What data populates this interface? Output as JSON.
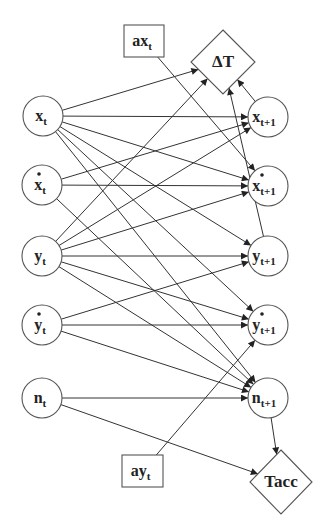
{
  "diagram": {
    "type": "dynamic bayesian network",
    "colors": {
      "stroke": "#333333",
      "background": "#ffffff",
      "text": "#222222"
    },
    "nodes": [
      {
        "id": "xt",
        "shape": "circle",
        "label": "x",
        "sub": "t",
        "dot": false,
        "cx": 43,
        "cy": 116,
        "r": 20
      },
      {
        "id": "dxt",
        "shape": "circle",
        "label": "x",
        "sub": "t",
        "dot": true,
        "cx": 42,
        "cy": 185,
        "r": 20
      },
      {
        "id": "yt",
        "shape": "circle",
        "label": "y",
        "sub": "t",
        "dot": false,
        "cx": 42,
        "cy": 256,
        "r": 20
      },
      {
        "id": "dyt",
        "shape": "circle",
        "label": "y",
        "sub": "t",
        "dot": true,
        "cx": 42,
        "cy": 325,
        "r": 20
      },
      {
        "id": "nt",
        "shape": "circle",
        "label": "n",
        "sub": "t",
        "dot": false,
        "cx": 42,
        "cy": 398,
        "r": 20
      },
      {
        "id": "xt1",
        "shape": "circle",
        "label": "x",
        "sub": "t+1",
        "dot": false,
        "cx": 268,
        "cy": 117,
        "r": 20
      },
      {
        "id": "dxt1",
        "shape": "circle",
        "label": "x",
        "sub": "t+1",
        "dot": true,
        "cx": 268,
        "cy": 186,
        "r": 20
      },
      {
        "id": "yt1",
        "shape": "circle",
        "label": "y",
        "sub": "t+1",
        "dot": false,
        "cx": 268,
        "cy": 256,
        "r": 20
      },
      {
        "id": "dyt1",
        "shape": "circle",
        "label": "y",
        "sub": "t+1",
        "dot": true,
        "cx": 268,
        "cy": 325,
        "r": 20
      },
      {
        "id": "nt1",
        "shape": "circle",
        "label": "n",
        "sub": "t+1",
        "dot": false,
        "cx": 268,
        "cy": 398,
        "r": 20
      },
      {
        "id": "axt",
        "shape": "box",
        "label": "ax",
        "sub": "t",
        "x": 124,
        "y": 25,
        "w": 40,
        "h": 32
      },
      {
        "id": "ayt",
        "shape": "box",
        "label": "ay",
        "sub": "t",
        "x": 122,
        "y": 455,
        "w": 41,
        "h": 32
      },
      {
        "id": "dT",
        "shape": "diamond",
        "label": "ΔT",
        "sub": "",
        "cx": 223,
        "cy": 62,
        "hw": 32,
        "hh": 32
      },
      {
        "id": "tacc",
        "shape": "diamond",
        "label": "Tacc",
        "sub": "",
        "cx": 281,
        "cy": 482,
        "hw": 31,
        "hh": 32
      }
    ],
    "edges": [
      {
        "from": "xt",
        "to": "dT"
      },
      {
        "from": "xt",
        "to": "xt1"
      },
      {
        "from": "xt",
        "to": "dxt1"
      },
      {
        "from": "xt",
        "to": "yt1"
      },
      {
        "from": "xt",
        "to": "dyt1"
      },
      {
        "from": "xt",
        "to": "nt1"
      },
      {
        "from": "dxt",
        "to": "xt1"
      },
      {
        "from": "dxt",
        "to": "dxt1"
      },
      {
        "from": "dxt",
        "to": "nt1"
      },
      {
        "from": "yt",
        "to": "dT"
      },
      {
        "from": "yt",
        "to": "xt1"
      },
      {
        "from": "yt",
        "to": "dxt1"
      },
      {
        "from": "yt",
        "to": "yt1"
      },
      {
        "from": "yt",
        "to": "dyt1"
      },
      {
        "from": "yt",
        "to": "nt1"
      },
      {
        "from": "dyt",
        "to": "yt1"
      },
      {
        "from": "dyt",
        "to": "dyt1"
      },
      {
        "from": "dyt",
        "to": "nt1"
      },
      {
        "from": "nt",
        "to": "nt1"
      },
      {
        "from": "nt",
        "to": "tacc"
      },
      {
        "from": "axt",
        "to": "dxt1"
      },
      {
        "from": "ayt",
        "to": "dyt1"
      },
      {
        "from": "xt1",
        "to": "dT"
      },
      {
        "from": "yt1",
        "to": "dT"
      },
      {
        "from": "nt1",
        "to": "tacc"
      }
    ]
  }
}
